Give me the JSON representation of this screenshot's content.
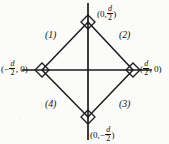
{
  "figure": {
    "background_color": "#fbfbfa",
    "line_color": "#1a1a1a",
    "width": 169,
    "height": 144
  },
  "axes": {
    "origin": {
      "x": 88,
      "y": 70
    },
    "x_axis": {
      "x1": 22,
      "y1": 70,
      "x2": 152,
      "y2": 70
    },
    "y_axis": {
      "x1": 88,
      "y1": 3,
      "x2": 88,
      "y2": 140
    }
  },
  "vertices": [
    {
      "name": "top",
      "x": 88,
      "y": 22,
      "label": "(0, d/2)"
    },
    {
      "name": "right",
      "x": 133,
      "y": 70,
      "label": "(d/2, 0)"
    },
    {
      "name": "bottom",
      "x": 88,
      "y": 117,
      "label": "(0, -d/2)"
    },
    {
      "name": "left",
      "x": 42,
      "y": 70,
      "label": "(-d/2, 0)"
    }
  ],
  "coordinate_labels": {
    "top": {
      "open": "(0,",
      "numerator": "d",
      "denominator": "2",
      "close": ")",
      "sign": ""
    },
    "right": {
      "open": "(",
      "numerator": "d",
      "denominator": "2",
      "close": ", 0)",
      "sign": ""
    },
    "bottom": {
      "open": "(0,",
      "numerator": "d",
      "denominator": "2",
      "close": ")",
      "sign": "−"
    },
    "left": {
      "open": "(",
      "numerator": "d",
      "denominator": "2",
      "close": ", 0)",
      "sign": "−"
    }
  },
  "quadrant_labels": [
    {
      "id": 1,
      "text": "(1)",
      "region": "top-left"
    },
    {
      "id": 2,
      "text": "(2)",
      "region": "top-right"
    },
    {
      "id": 3,
      "text": "(3)",
      "region": "bottom-right"
    },
    {
      "id": 4,
      "text": "(4)",
      "region": "bottom-left"
    }
  ],
  "right_angle_markers": {
    "shape": "rotated-square",
    "half_size": 7,
    "count": 4,
    "note": "small diamond drawn at each vertex of the square"
  }
}
